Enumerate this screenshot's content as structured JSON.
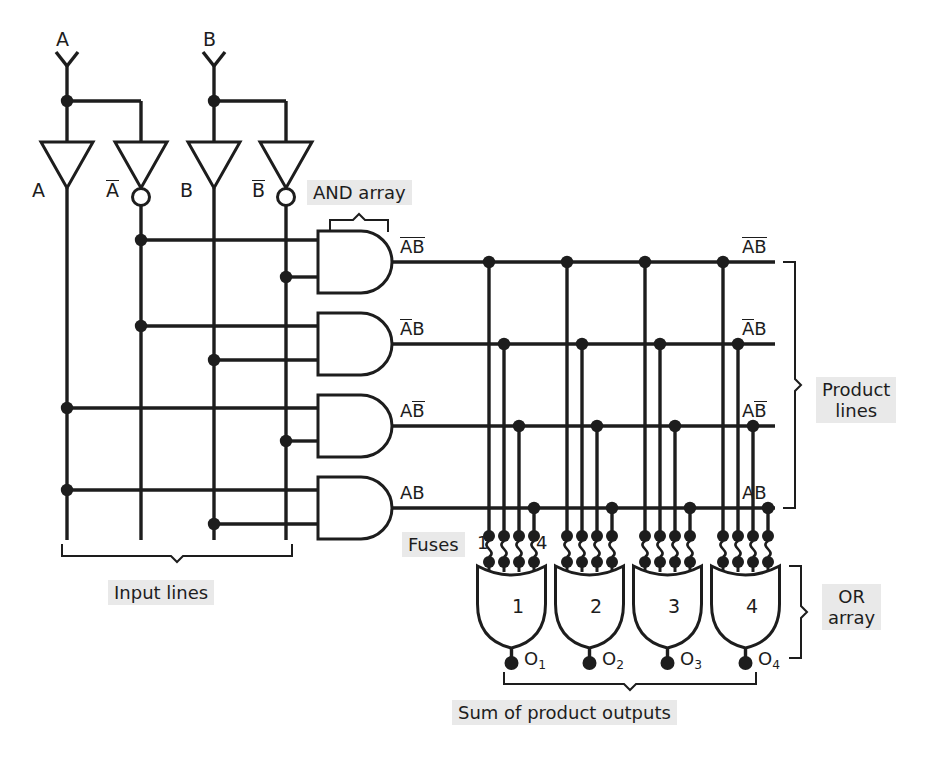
{
  "inputs": [
    {
      "name": "A",
      "pin_label": "A"
    },
    {
      "name": "B",
      "pin_label": "B"
    }
  ],
  "buffers": [
    {
      "label": "A",
      "inverted": false,
      "line": "A"
    },
    {
      "label": "A",
      "inverted": true,
      "line": "A-bar"
    },
    {
      "label": "B",
      "inverted": false,
      "line": "B"
    },
    {
      "label": "B",
      "inverted": true,
      "line": "B-bar"
    }
  ],
  "labels": {
    "and_array": "AND array",
    "or_array_line1": "OR",
    "or_array_line2": "array",
    "product_lines_line1": "Product",
    "product_lines_line2": "lines",
    "input_lines": "Input lines",
    "fuses": "Fuses",
    "fuse_first": "1",
    "fuse_last": "4",
    "sum_of_products": "Sum of product outputs"
  },
  "and_gates": [
    {
      "index": 1,
      "product": "A-bar B-bar",
      "terms": [
        "A-bar",
        "B-bar"
      ]
    },
    {
      "index": 2,
      "product": "A-bar B",
      "terms": [
        "A-bar",
        "B"
      ]
    },
    {
      "index": 3,
      "product": "A B-bar",
      "terms": [
        "A",
        "B-bar"
      ]
    },
    {
      "index": 4,
      "product": "A B",
      "terms": [
        "A",
        "B"
      ]
    }
  ],
  "product_line_labels_left": [
    "A-bar B-bar",
    "A-bar B",
    "A B-bar",
    "A B"
  ],
  "product_line_labels_right": [
    "A-bar B-bar",
    "A-bar B",
    "A B-bar",
    "A B"
  ],
  "or_gates": [
    {
      "number": "1",
      "output": "O",
      "output_sub": "1"
    },
    {
      "number": "2",
      "output": "O",
      "output_sub": "2"
    },
    {
      "number": "3",
      "output": "O",
      "output_sub": "3"
    },
    {
      "number": "4",
      "output": "O",
      "output_sub": "4"
    }
  ],
  "colors": {
    "ink": "#1d1d1d",
    "paper": "#ffffff",
    "label_shade": "#e9e9e9"
  }
}
